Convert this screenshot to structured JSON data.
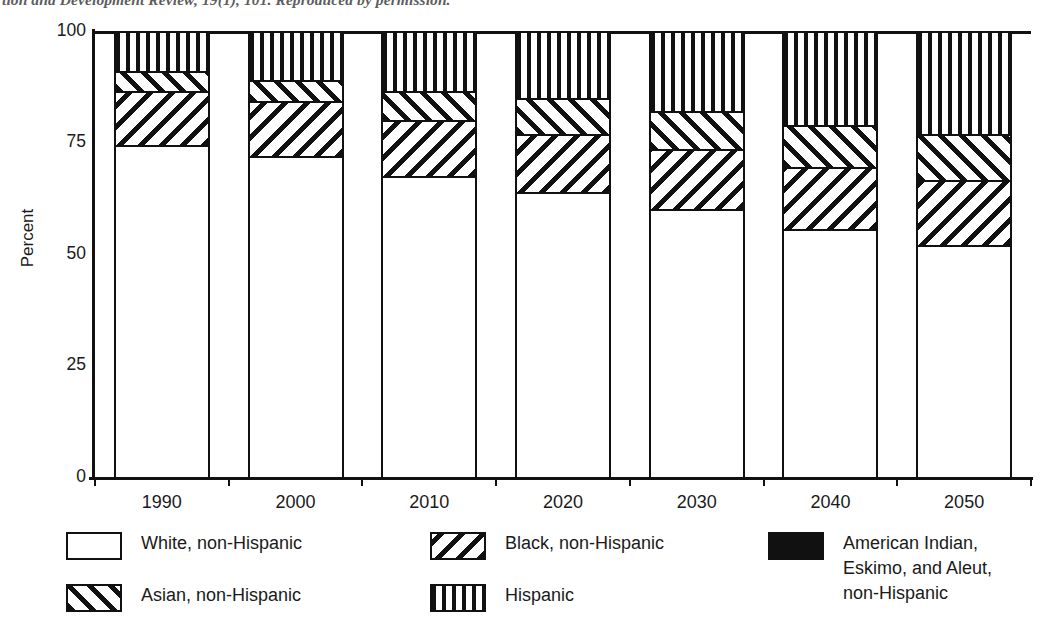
{
  "caption": {
    "text": "tion and Development Review, 19(1), 101. Reproduced by permission."
  },
  "axes": {
    "y_title": "Percent",
    "y_ticks": [
      "0",
      "25",
      "50",
      "75",
      "100"
    ],
    "x_ticks": [
      "1990",
      "2000",
      "2010",
      "2020",
      "2030",
      "2040",
      "2050"
    ]
  },
  "legend": {
    "items": [
      {
        "key": "white",
        "label": "White, non-Hispanic",
        "pattern": "pat-white",
        "swatch_name": "legend-swatch-white"
      },
      {
        "key": "black",
        "label": "Black, non-Hispanic",
        "pattern": "pat-black-hatch",
        "swatch_name": "legend-swatch-black"
      },
      {
        "key": "amerind",
        "label": "American Indian,\nEskimo, and Aleut,\nnon-Hispanic",
        "pattern": "pat-solid-black",
        "swatch_name": "legend-swatch-american-indian"
      },
      {
        "key": "asian",
        "label": "Asian, non-Hispanic",
        "pattern": "pat-asian-hatch",
        "swatch_name": "legend-swatch-asian"
      },
      {
        "key": "hispanic",
        "label": "Hispanic",
        "pattern": "pat-vertical",
        "swatch_name": "legend-swatch-hispanic"
      }
    ]
  },
  "chart_data": {
    "type": "bar",
    "subtype": "stacked",
    "title": "",
    "xlabel": "",
    "ylabel": "Percent",
    "ylim": [
      0,
      100
    ],
    "grid": false,
    "legend_position": "bottom",
    "categories": [
      "1990",
      "2000",
      "2010",
      "2020",
      "2030",
      "2040",
      "2050"
    ],
    "series": [
      {
        "name": "White, non-Hispanic",
        "pattern": "pat-white",
        "values": [
          74.5,
          72.0,
          67.5,
          64.0,
          60.0,
          55.5,
          52.0
        ]
      },
      {
        "name": "Black, non-Hispanic",
        "pattern": "pat-black-hatch",
        "values": [
          12.1,
          12.2,
          12.5,
          13.0,
          13.5,
          14.0,
          14.5
        ]
      },
      {
        "name": "Asian, non-Hispanic",
        "pattern": "pat-asian-hatch",
        "values": [
          4.4,
          4.8,
          6.5,
          8.0,
          8.5,
          9.5,
          10.5
        ]
      },
      {
        "name": "Hispanic",
        "pattern": "pat-vertical",
        "values": [
          9.0,
          11.0,
          13.5,
          15.0,
          18.0,
          21.0,
          23.0
        ]
      }
    ]
  }
}
